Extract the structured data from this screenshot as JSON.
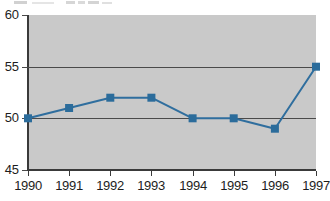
{
  "chart_data": {
    "type": "line",
    "title": "",
    "subtitle": "",
    "xlabel": "",
    "ylabel": "",
    "categories": [
      "1990",
      "1991",
      "1992",
      "1993",
      "1994",
      "1995",
      "1996",
      "1997"
    ],
    "values": [
      50,
      51,
      52,
      52,
      50,
      50,
      49,
      55
    ],
    "series": [
      {
        "name": "",
        "values": [
          50,
          51,
          52,
          52,
          50,
          50,
          49,
          55
        ]
      }
    ],
    "xlim": [
      1990,
      1997
    ],
    "ylim": [
      45,
      60
    ],
    "ytick_labels": [
      "60",
      "55",
      "50",
      "45"
    ],
    "ytick_values": [
      60,
      55,
      50,
      45
    ],
    "xtick_labels": [
      "1990",
      "1991",
      "1992",
      "1993",
      "1994",
      "1995",
      "1996",
      "1997"
    ],
    "grid": true,
    "gridlines_at": [
      55,
      50
    ],
    "legend": "none",
    "legend_position": "none",
    "marker": "square",
    "annotations": [],
    "colors": {
      "line": "#2f6e9e",
      "marker": "#2b6c9b",
      "plot_background": "#c9c9c9",
      "figure_background": "#ffffff",
      "axis": "#3a3a3a",
      "gridline": "#4a4a4a",
      "tick_label": "#1d1d1d"
    }
  }
}
